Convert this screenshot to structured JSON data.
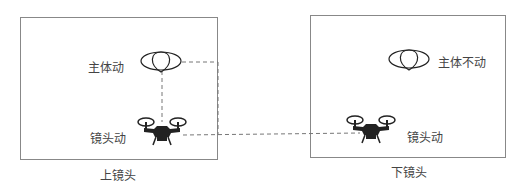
{
  "panels": [
    {
      "caption": "上镜头",
      "subject_label": "主体动",
      "camera_label": "镜头动"
    },
    {
      "caption": "下镜头",
      "subject_label": "主体不动",
      "camera_label": "镜头动"
    }
  ],
  "colors": {
    "line": "#888888",
    "dash": "#777777",
    "icon": "#222222"
  }
}
